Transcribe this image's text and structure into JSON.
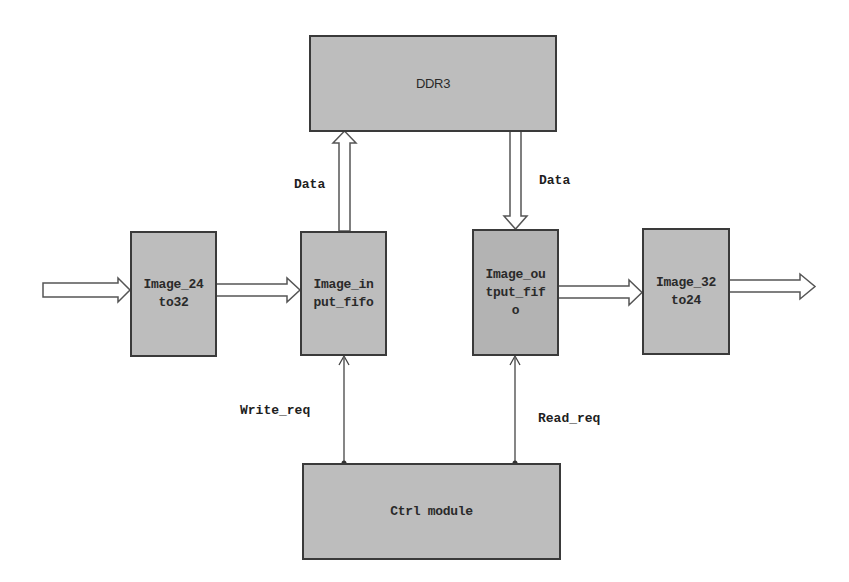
{
  "diagram": {
    "type": "block-diagram",
    "colors": {
      "block_fill": "#bdbdbd",
      "block_fill_dark": "#b3b3b3",
      "stroke": "#3a3a3a",
      "arrow_fill": "#ffffff",
      "background": "#ffffff"
    },
    "nodes": {
      "ddr3": {
        "label": "DDR3"
      },
      "image_24to32": {
        "label": "Image_24\nto32"
      },
      "image_input_fifo": {
        "label": "Image_in\nput_fifo"
      },
      "image_output_fifo": {
        "label": "Image_ou\ntput_fif\no"
      },
      "image_32to24": {
        "label": "Image_32\nto24"
      },
      "ctrl_module": {
        "label": "Ctrl module"
      }
    },
    "edges": {
      "input_to_24to32": {
        "label": ""
      },
      "24to32_to_input_fifo": {
        "label": ""
      },
      "input_fifo_to_ddr3": {
        "label": "Data"
      },
      "ddr3_to_output_fifo": {
        "label": "Data"
      },
      "output_fifo_to_32to24": {
        "label": ""
      },
      "32to24_to_output": {
        "label": ""
      },
      "ctrl_to_input_fifo": {
        "label": "Write_req"
      },
      "ctrl_to_output_fifo": {
        "label": "Read_req"
      }
    }
  }
}
